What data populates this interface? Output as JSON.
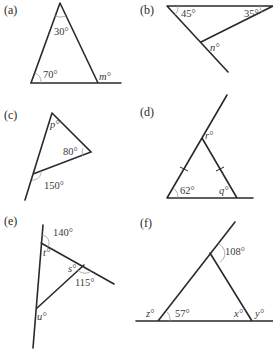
{
  "figure": {
    "parts": [
      {
        "id": "a",
        "label": "(a)",
        "angles": {
          "apex": "30°",
          "base_left": "70°",
          "exterior": "m°"
        }
      },
      {
        "id": "b",
        "label": "(b)",
        "angles": {
          "top_left": "45°",
          "top_right": "35°",
          "exterior": "n°"
        }
      },
      {
        "id": "c",
        "label": "(c)",
        "angles": {
          "top": "p°",
          "right": "80°",
          "exterior": "150°"
        }
      },
      {
        "id": "d",
        "label": "(d)",
        "angles": {
          "base_left": "62°",
          "base_right": "q°",
          "exterior": "r°"
        }
      },
      {
        "id": "e",
        "label": "(e)",
        "angles": {
          "exterior_top": "140°",
          "top": "t°",
          "right": "s°",
          "exterior_right": "115°",
          "bottom": "u°"
        }
      },
      {
        "id": "f",
        "label": "(f)",
        "angles": {
          "exterior_top": "108°",
          "base_left": "57°",
          "exterior_left": "z°",
          "base_right": "x°",
          "exterior_right": "y°"
        }
      }
    ]
  }
}
